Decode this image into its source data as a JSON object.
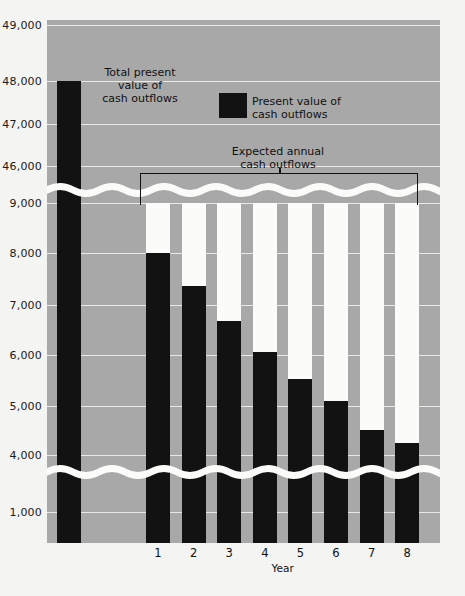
{
  "chart_data": {
    "type": "bar",
    "title": "",
    "xlabel": "Year",
    "ylabel": "",
    "grid": true,
    "axis_break": true,
    "categories": [
      "1",
      "2",
      "3",
      "4",
      "5",
      "6",
      "7",
      "8"
    ],
    "y_ticks_upper": [
      "49,000",
      "48,000",
      "47,000",
      "46,000"
    ],
    "y_ticks_lower": [
      "9,000",
      "8,000",
      "7,000",
      "6,000",
      "5,000",
      "4,000",
      "1,000"
    ],
    "y_ticks_all": [
      "49,000",
      "48,000",
      "47,000",
      "46,000",
      "9,000",
      "8,000",
      "7,000",
      "6,000",
      "5,000",
      "4,000",
      "1,000"
    ],
    "total_bar": {
      "label": "Total present value of cash outflows",
      "value": 48000
    },
    "series": [
      {
        "name": "Present value of cash outflows",
        "values": [
          8000,
          7350,
          6650,
          6050,
          5500,
          5080,
          4500,
          4230
        ]
      },
      {
        "name": "Expected annual cash outflows",
        "values": [
          9000,
          9000,
          9000,
          9000,
          9000,
          9000,
          9000,
          9000
        ]
      }
    ],
    "annotations": [
      "Total present value of cash outflows",
      "Present value of cash outflows",
      "Expected annual cash outflows"
    ],
    "colors": {
      "plot_background": "#a8a8a8",
      "bar_dark": "#121212",
      "bar_light": "#fbfbfa",
      "gridline": "#e9e9e7",
      "page_background": "#f4f4f2"
    }
  },
  "annotations": {
    "total_pv": "Total present\nvalue of\ncash outflows",
    "total_pv_l1": "Total present",
    "total_pv_l2": "value of",
    "total_pv_l3": "cash outflows",
    "legend_l1": "Present value of",
    "legend_l2": "cash outflows",
    "bracket_l1": "Expected annual",
    "bracket_l2": "cash outflows"
  },
  "axis": {
    "x_title": "Year",
    "x_labels": [
      "1",
      "2",
      "3",
      "4",
      "5",
      "6",
      "7",
      "8"
    ],
    "y_labels": [
      "49,000",
      "48,000",
      "47,000",
      "46,000",
      "9,000",
      "8,000",
      "7,000",
      "6,000",
      "5,000",
      "4,000",
      "1,000"
    ]
  }
}
